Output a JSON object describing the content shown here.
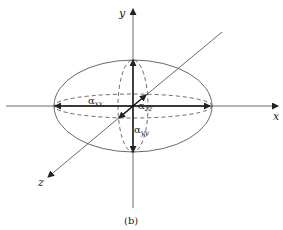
{
  "figure": {
    "caption": "(b)",
    "axes": {
      "x": {
        "label": "x"
      },
      "y": {
        "label": "y"
      },
      "z": {
        "label": "z"
      }
    },
    "components": {
      "alpha_xx": {
        "symbol": "α",
        "subscript": "xx"
      },
      "alpha_yy": {
        "symbol": "α",
        "subscript": "yy"
      },
      "alpha_zz": {
        "symbol": "α",
        "subscript": "zz"
      }
    },
    "colors": {
      "line": "#333333",
      "background": "#ffffff"
    }
  }
}
